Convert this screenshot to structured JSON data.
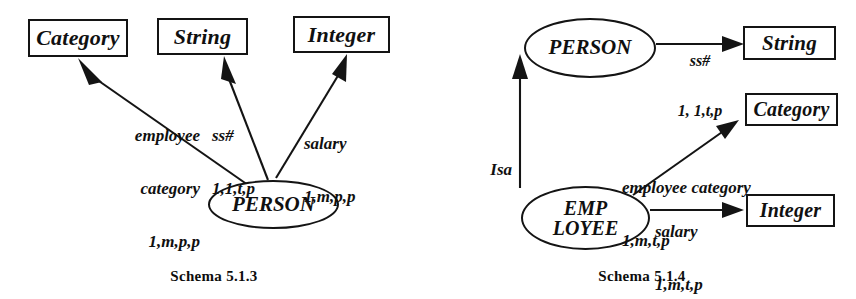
{
  "page": {
    "background": "#ffffff",
    "ink": "#141414"
  },
  "figures": [
    {
      "id": "schema-513",
      "caption": "Schema 5.1.3",
      "nodes": [
        {
          "id": "category",
          "shape": "box",
          "label": "Category"
        },
        {
          "id": "string",
          "shape": "box",
          "label": "String"
        },
        {
          "id": "integer",
          "shape": "box",
          "label": "Integer"
        },
        {
          "id": "person",
          "shape": "ellipse",
          "label": "PERSON"
        }
      ],
      "edges": [
        {
          "id": "employee-category",
          "from": "person",
          "to": "category",
          "name_line1": "employee",
          "name_line2": "category",
          "cardinality": "1,m,p,p"
        },
        {
          "id": "ss-number",
          "from": "person",
          "to": "string",
          "name_line1": "ss#",
          "name_line2": "",
          "cardinality": "1,1,t,p"
        },
        {
          "id": "salary",
          "from": "person",
          "to": "integer",
          "name_line1": "salary",
          "name_line2": "",
          "cardinality": "1,m,p,p"
        }
      ]
    },
    {
      "id": "schema-514",
      "caption": "Schema 5.1.4",
      "nodes": [
        {
          "id": "person",
          "shape": "ellipse",
          "label": "PERSON"
        },
        {
          "id": "employee",
          "shape": "ellipse",
          "label_line1": "EMP",
          "label_line2": "LOYEE"
        },
        {
          "id": "string",
          "shape": "box",
          "label": "String"
        },
        {
          "id": "category",
          "shape": "box",
          "label": "Category"
        },
        {
          "id": "integer",
          "shape": "box",
          "label": "Integer"
        }
      ],
      "edges": [
        {
          "id": "ss-number",
          "from": "person",
          "to": "string",
          "name_line1": "ss#",
          "name_line2": "",
          "cardinality": "1, 1,t,p"
        },
        {
          "id": "isa",
          "from": "employee",
          "to": "person",
          "name_line1": "Isa",
          "name_line2": "",
          "cardinality": ""
        },
        {
          "id": "employee-category",
          "from": "employee",
          "to": "category",
          "name_line1": "employee category",
          "name_line2": "",
          "cardinality": "1,m,t,p"
        },
        {
          "id": "salary",
          "from": "employee",
          "to": "integer",
          "name_line1": "salary",
          "name_line2": "",
          "cardinality": "1,m,t,p"
        }
      ]
    }
  ]
}
